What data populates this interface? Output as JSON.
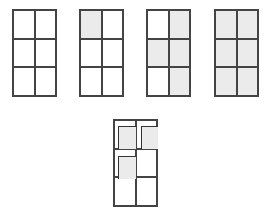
{
  "figure": {
    "colors": {
      "line": "#444444",
      "shade": "#ebebeb",
      "background": "#ffffff"
    },
    "grids": [
      {
        "id": "grid-1",
        "x": 12,
        "y": 9,
        "shaded": [
          false,
          false,
          false,
          false,
          false,
          false
        ]
      },
      {
        "id": "grid-2",
        "x": 79,
        "y": 9,
        "shaded": [
          true,
          false,
          false,
          false,
          false,
          false
        ]
      },
      {
        "id": "grid-3",
        "x": 146,
        "y": 9,
        "shaded": [
          false,
          true,
          true,
          true,
          false,
          true
        ]
      },
      {
        "id": "grid-4",
        "x": 214,
        "y": 9,
        "shaded": [
          true,
          true,
          true,
          true,
          true,
          true
        ]
      }
    ],
    "bottom_grid": {
      "id": "grid-5",
      "x": 113,
      "y": 119,
      "insets": [
        {
          "cell": "top-left",
          "x": 118,
          "y": 126,
          "w": 18,
          "h": 23
        },
        {
          "cell": "top-right",
          "x": 141,
          "y": 126,
          "w": 17,
          "h": 23
        },
        {
          "cell": "middle-left",
          "x": 118,
          "y": 156,
          "w": 18,
          "h": 23
        }
      ]
    }
  }
}
